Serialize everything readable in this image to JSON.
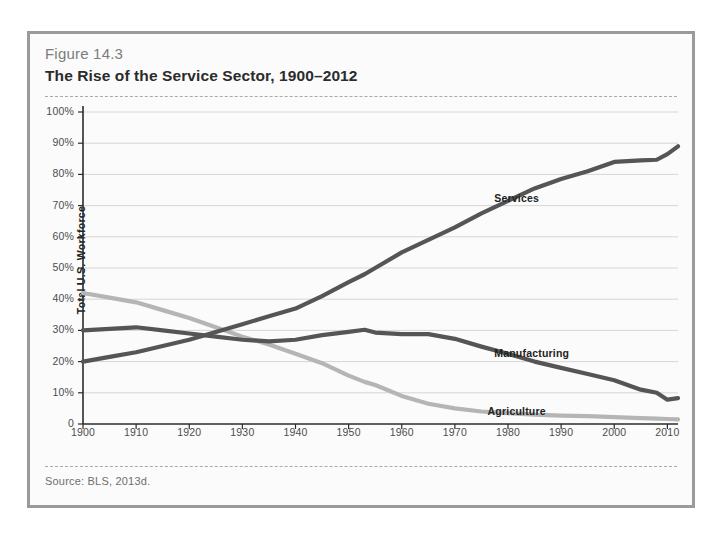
{
  "figure": {
    "number": "Figure 14.3",
    "title": "The Rise of the Service Sector, 1900–2012",
    "source": "Source: BLS, 2013d."
  },
  "chart_data": {
    "type": "line",
    "title": "The Rise of the Service Sector, 1900–2012",
    "xlabel": "",
    "ylabel": "Total U.S. Workforce",
    "xlim": [
      1900,
      2012
    ],
    "ylim": [
      0,
      100
    ],
    "grid": true,
    "legend_position": "inline-labels",
    "y_ticks": [
      "0",
      "10%",
      "20%",
      "30%",
      "40%",
      "50%",
      "60%",
      "70%",
      "80%",
      "90%",
      "100%"
    ],
    "y_tick_values": [
      0,
      10,
      20,
      30,
      40,
      50,
      60,
      70,
      80,
      90,
      100
    ],
    "x_ticks": [
      "1900",
      "1910",
      "1920",
      "1930",
      "1940",
      "1950",
      "1960",
      "1970",
      "1980",
      "1990",
      "2000",
      "2010"
    ],
    "x_tick_values": [
      1900,
      1910,
      1920,
      1930,
      1940,
      1950,
      1960,
      1970,
      1980,
      1990,
      2000,
      2010
    ],
    "x": [
      1900,
      1905,
      1910,
      1915,
      1920,
      1925,
      1930,
      1935,
      1940,
      1945,
      1950,
      1953,
      1955,
      1960,
      1965,
      1970,
      1975,
      1980,
      1985,
      1990,
      1995,
      2000,
      2005,
      2008,
      2010,
      2012
    ],
    "series": [
      {
        "name": "Services",
        "color": "#555555",
        "values": [
          20.0,
          21.5,
          23.0,
          25.0,
          27.0,
          29.5,
          32.0,
          34.5,
          37.0,
          41.0,
          45.5,
          48.0,
          50.0,
          55.0,
          59.0,
          63.0,
          67.5,
          71.5,
          75.5,
          78.5,
          81.0,
          84.0,
          84.5,
          84.7,
          86.5,
          89.0
        ],
        "label_text": "Services",
        "label_x_pct": 69.5,
        "label_y_pct": 24.5
      },
      {
        "name": "Manufacturing",
        "color": "#555555",
        "values": [
          30.0,
          30.5,
          31.0,
          30.0,
          29.0,
          28.0,
          27.0,
          26.5,
          27.0,
          28.5,
          29.5,
          30.2,
          29.3,
          28.8,
          28.8,
          27.3,
          24.8,
          22.5,
          20.0,
          18.0,
          16.0,
          14.0,
          11.0,
          10.0,
          7.8,
          8.3
        ],
        "label_text": "Manufacturing",
        "label_x_pct": 69.5,
        "label_y_pct": 67.5
      },
      {
        "name": "Agriculture",
        "color": "#b5b5b5",
        "values": [
          42.0,
          40.5,
          39.0,
          36.5,
          34.0,
          31.0,
          28.0,
          25.5,
          22.5,
          19.5,
          15.5,
          13.5,
          12.5,
          9.0,
          6.5,
          5.0,
          4.0,
          3.5,
          3.0,
          2.7,
          2.5,
          2.2,
          1.9,
          1.7,
          1.6,
          1.5
        ],
        "label_text": "Agriculture",
        "label_x_pct": 68.5,
        "label_y_pct": 83.5
      }
    ]
  }
}
